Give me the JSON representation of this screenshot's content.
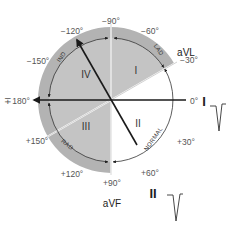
{
  "diagram": {
    "type": "hexaxial-reference-system",
    "colors": {
      "shaded_sector": "#bdbdbd",
      "outer_ring": "#a9a9a9",
      "axis_line": "#1a1a1a",
      "background": "#ffffff"
    },
    "angle_labels": {
      "minus90": "−90°",
      "minus60": "−60°",
      "minus30": "−30°",
      "minus120": "−120°",
      "minus150": "−150°",
      "pm180": "∓180°",
      "zero": "0°",
      "plus30": "+30°",
      "plus60": "+60°",
      "plus90": "+90°",
      "plus120": "+120°",
      "plus150": "+150°"
    },
    "quadrants": {
      "q1": "I",
      "q2": "II",
      "q3": "III",
      "q4": "IV"
    },
    "arc_labels": {
      "lad": "LAD",
      "normal": "NORMAL",
      "rad": "RAD",
      "ind": "IND"
    },
    "leads": {
      "avl": "aVL",
      "lead_i": "I",
      "lead_ii": "II",
      "avf": "aVF"
    }
  }
}
